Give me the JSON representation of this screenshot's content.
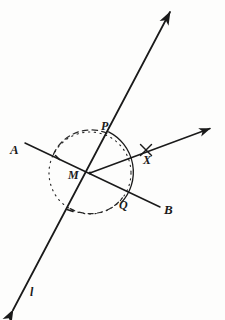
{
  "figure": {
    "type": "geometry-construction",
    "background_color": "#fdfdfc",
    "ink_color": "#1a1a1a",
    "canvas": {
      "width": 225,
      "height": 320
    }
  },
  "labels": [
    {
      "key": "A",
      "text": "A",
      "x": 10,
      "y": 143,
      "font_size": 13,
      "style": "italic-serif",
      "describes": "left endpoint of line AB"
    },
    {
      "key": "M",
      "text": "M",
      "x": 68,
      "y": 169,
      "font_size": 12,
      "style": "italic-serif",
      "describes": "intersection point of line l and line AB"
    },
    {
      "key": "P",
      "text": "P",
      "x": 101,
      "y": 120,
      "font_size": 12,
      "style": "italic-serif",
      "describes": "point where circle meets line l above M"
    },
    {
      "key": "Q",
      "text": "Q",
      "x": 119,
      "y": 199,
      "font_size": 12,
      "style": "italic-serif",
      "describes": "point where circle meets line AB right of M"
    },
    {
      "key": "B",
      "text": "B",
      "x": 164,
      "y": 203,
      "font_size": 13,
      "style": "italic-serif",
      "describes": "right endpoint of line AB"
    },
    {
      "key": "X",
      "text": "X",
      "x": 143,
      "y": 154,
      "font_size": 12,
      "style": "italic-serif",
      "describes": "point marked by a cross on ray from M"
    },
    {
      "key": "l",
      "text": "l",
      "x": 30,
      "y": 286,
      "font_size": 12,
      "style": "italic-serif",
      "describes": "name of the steep transversal line"
    }
  ],
  "points": {
    "M": {
      "x": 90,
      "y": 173
    },
    "P": {
      "x": 108,
      "y": 133
    },
    "Q": {
      "x": 122,
      "y": 198
    },
    "X": {
      "x": 146,
      "y": 150
    }
  },
  "lines": [
    {
      "name": "line-l",
      "label": "l",
      "style": "solid",
      "stroke_width": 1.7,
      "arrows": "both",
      "from": {
        "x": 13,
        "y": 310
      },
      "to": {
        "x": 170,
        "y": 12
      }
    },
    {
      "name": "line-AB",
      "label": "AB",
      "style": "solid",
      "stroke_width": 1.5,
      "arrows": "none",
      "from": {
        "x": 25,
        "y": 143
      },
      "to": {
        "x": 160,
        "y": 207
      }
    },
    {
      "name": "ray-MX",
      "label": "MX",
      "style": "solid",
      "stroke_width": 1.5,
      "arrows": "end",
      "from": {
        "x": 90,
        "y": 173
      },
      "to": {
        "x": 212,
        "y": 128
      }
    }
  ],
  "arcs": [
    {
      "name": "construction-circle",
      "style": "dashed-dotted",
      "center": {
        "x": 90,
        "y": 173
      },
      "radius": 41,
      "start_angle_deg": 0,
      "end_angle_deg": 360,
      "stroke_width": 1.2,
      "describes": "dotted circle centered at M used to locate P and Q"
    },
    {
      "name": "angle-arc-PQ",
      "style": "solid",
      "center": {
        "x": 90,
        "y": 173
      },
      "radius": 45,
      "start_angle_deg": -66,
      "end_angle_deg": 29,
      "stroke_width": 1.3,
      "describes": "solid arc drawn from P around to Q spanning the angle at M"
    }
  ],
  "marks": [
    {
      "name": "cross-mark-X",
      "glyph": "cross",
      "x": 146,
      "y": 150,
      "size": 11,
      "describes": "small x shaped tick marking point X on the ray"
    },
    {
      "name": "tick-line-AB",
      "glyph": "tick",
      "x": 57,
      "y": 157,
      "describes": "small tick on segment AM"
    },
    {
      "name": "tick-line-l",
      "glyph": "tick",
      "x": 70,
      "y": 210,
      "describes": "small tick on line l below M"
    }
  ]
}
